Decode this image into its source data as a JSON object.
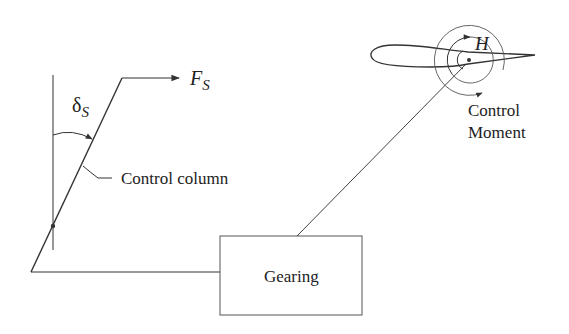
{
  "diagram": {
    "labels": {
      "force": "F",
      "force_sub": "S",
      "deflection": "δ",
      "deflection_sub": "S",
      "hinge_moment": "H",
      "control_column": "Control column",
      "gearing": "Gearing",
      "control_moment_line1": "Control",
      "control_moment_line2": "Moment"
    },
    "colors": {
      "stroke": "#333333",
      "text": "#222222",
      "background": "#ffffff"
    }
  }
}
